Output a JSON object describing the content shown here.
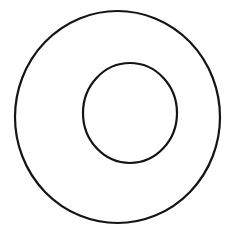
{
  "figure": {
    "stroke_color": "#141414",
    "background_color": "#ffffff",
    "shapes": [
      {
        "name": "outer-circle",
        "kind": "circle"
      },
      {
        "name": "inner-circle",
        "kind": "circle"
      }
    ]
  }
}
